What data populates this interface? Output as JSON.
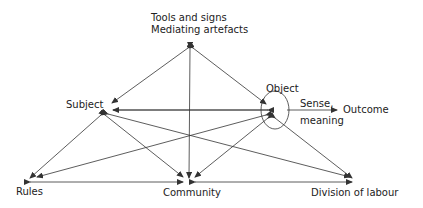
{
  "nodes": {
    "tools": {
      "line1": "Tools and signs",
      "line2": "Mediating artefacts"
    },
    "subject": {
      "label": "Subject"
    },
    "object": {
      "label": "Object"
    },
    "sense": {
      "line1": "Sense,",
      "line2": "meaning"
    },
    "outcome": {
      "label": "Outcome"
    },
    "rules": {
      "label": "Rules"
    },
    "community": {
      "label": "Community"
    },
    "division": {
      "label": "Division of labour"
    }
  },
  "colors": {
    "line": "#333333",
    "text": "#222222"
  }
}
